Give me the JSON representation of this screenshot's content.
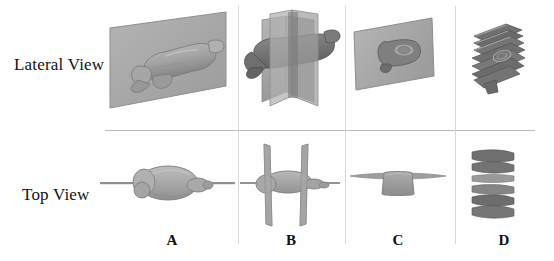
{
  "figure": {
    "background_color": "#fefefe",
    "divider_color": "#b9b9b9",
    "row_labels": [
      {
        "id": "lateral",
        "label": "Lateral View"
      },
      {
        "id": "top",
        "label": "Top View"
      }
    ],
    "column_labels": [
      {
        "id": "a",
        "label": "A"
      },
      {
        "id": "b",
        "label": "B"
      },
      {
        "id": "c",
        "label": "C"
      },
      {
        "id": "d",
        "label": "D"
      }
    ],
    "palette": {
      "brain_light": "#b3b3b3",
      "brain_mid": "#9d9d9d",
      "brain_dark": "#7a7a7a",
      "brain_shadow": "#616161",
      "plane_fill": "#a8a8a8",
      "plane_edge": "#8e8e8e",
      "slab_fill": "#6f6f6f",
      "slab_edge": "#575757",
      "line_gray": "#9a9a9a"
    },
    "panels": [
      {
        "id": "a-lateral",
        "column": "A",
        "row": "Lateral View",
        "description": "Single large sagittal plane intersecting a 3D brain, viewed laterally"
      },
      {
        "id": "b-lateral",
        "column": "B",
        "row": "Lateral View",
        "description": "Two vertical coronal planes cutting through the brain, viewed laterally"
      },
      {
        "id": "c-lateral",
        "column": "C",
        "row": "Lateral View",
        "description": "Single coronal plane in front of the brain, viewed laterally"
      },
      {
        "id": "d-lateral",
        "column": "D",
        "row": "Lateral View",
        "description": "Stack of dark coronal slices of the brain, viewed laterally"
      },
      {
        "id": "a-top",
        "column": "A",
        "row": "Top View",
        "description": "Brain seen from above with a single horizontal sagittal line plane through the midline"
      },
      {
        "id": "b-top",
        "column": "B",
        "row": "Top View",
        "description": "Brain seen from above with two vertical plane edges crossing it"
      },
      {
        "id": "c-top",
        "column": "C",
        "row": "Top View",
        "description": "Brain seen from above with a single flat plane edge across it"
      },
      {
        "id": "d-top",
        "column": "D",
        "row": "Top View",
        "description": "Six stacked slice bars seen from above"
      }
    ]
  }
}
